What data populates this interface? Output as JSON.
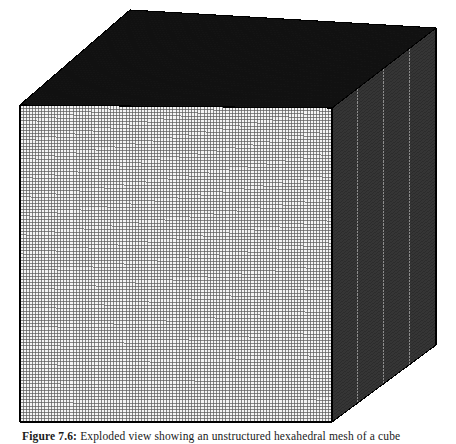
{
  "page": {
    "background_color": "#ffffff",
    "width": 456,
    "height": 444
  },
  "figure": {
    "type": "3d-structured-mesh-cube",
    "alt_description": "Isometric view of a cube discretized by a uniform structured hexahedral grid",
    "caption_label": "Figure 7.6:",
    "caption_text": "Exploded view showing an unstructured hexahedral mesh of a cube",
    "caption_clipped": true
  },
  "geometry": {
    "projection": "isometric",
    "vertices": {
      "front_top_left": [
        20,
        105
      ],
      "front_top_right": [
        332,
        108
      ],
      "front_bot_right": [
        332,
        422
      ],
      "front_bot_left": [
        20,
        422
      ],
      "back_top_left": [
        130,
        10
      ],
      "back_top_right": [
        436,
        28
      ],
      "back_bot_right": [
        436,
        345
      ]
    },
    "faces": [
      {
        "name": "front-face",
        "divisions_u": 100,
        "divisions_v": 100,
        "fill": "#f2f2f2",
        "line_color": "#5a5a5a",
        "mean_tone": "#b9b9b9"
      },
      {
        "name": "top-face",
        "divisions_u": 100,
        "divisions_v": 100,
        "fill": "#4a4a4a",
        "line_color": "#111111",
        "mean_tone": "#3a3a3a"
      },
      {
        "name": "right-face",
        "divisions_u": 100,
        "divisions_v": 100,
        "fill": "#8a8a8a",
        "line_color": "#2b2b2b",
        "mean_tone": "#6e6e6e"
      }
    ],
    "edge_color": "#000000",
    "grid_cells_total": "100 x 100 x 100"
  },
  "chart_data": {
    "type": "diagram",
    "title": "Structured hexahedral mesh of a cube",
    "faces": [
      {
        "label": "top",
        "nx": 100,
        "ny": 100,
        "shade": 0.24
      },
      {
        "label": "front",
        "nx": 100,
        "ny": 100,
        "shade": 0.82
      },
      {
        "label": "right",
        "nx": 100,
        "ny": 100,
        "shade": 0.52
      }
    ]
  }
}
